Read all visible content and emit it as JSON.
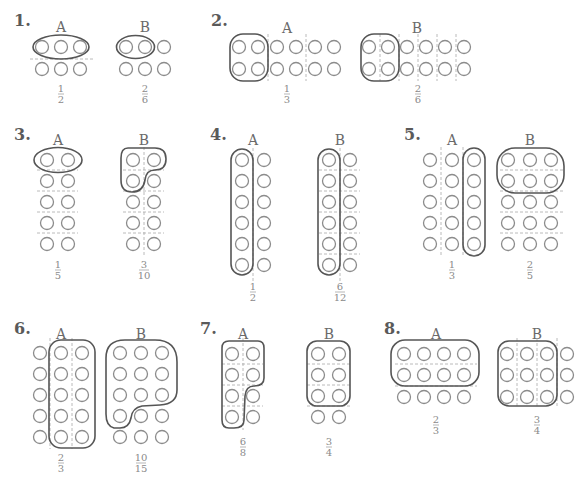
{
  "colors": {
    "circle": "#8c8c8c",
    "group_outline": "#555555",
    "divider": "#a8a8a8",
    "text": "#6a6a6a"
  },
  "problems": [
    {
      "number": "1.",
      "A": {
        "label": "A",
        "numerator": "1",
        "denominator": "2",
        "grid": "3x2"
      },
      "B": {
        "label": "B",
        "numerator": "2",
        "denominator": "6",
        "grid": "3x2"
      }
    },
    {
      "number": "2.",
      "A": {
        "label": "A",
        "numerator": "1",
        "denominator": "3",
        "grid": "6x2"
      },
      "B": {
        "label": "B",
        "numerator": "2",
        "denominator": "6",
        "grid": "6x2"
      }
    },
    {
      "number": "3.",
      "A": {
        "label": "A",
        "numerator": "1",
        "denominator": "5",
        "grid": "2x5"
      },
      "B": {
        "label": "B",
        "numerator": "3",
        "denominator": "10",
        "grid": "2x5"
      }
    },
    {
      "number": "4.",
      "A": {
        "label": "A",
        "numerator": "1",
        "denominator": "2",
        "grid": "2x6"
      },
      "B": {
        "label": "B",
        "numerator": "6",
        "denominator": "12",
        "grid": "2x6"
      }
    },
    {
      "number": "5.",
      "A": {
        "label": "A",
        "numerator": "1",
        "denominator": "3",
        "grid": "3x5"
      },
      "B": {
        "label": "B",
        "numerator": "2",
        "denominator": "5",
        "grid": "3x5"
      }
    },
    {
      "number": "6.",
      "A": {
        "label": "A",
        "numerator": "2",
        "denominator": "3",
        "grid": "3x5"
      },
      "B": {
        "label": "B",
        "numerator": "10",
        "denominator": "15",
        "grid": "3x5"
      }
    },
    {
      "number": "7.",
      "A": {
        "label": "A",
        "numerator": "6",
        "denominator": "8",
        "grid": "2x4"
      },
      "B": {
        "label": "B",
        "numerator": "3",
        "denominator": "4",
        "grid": "2x4"
      }
    },
    {
      "number": "8.",
      "A": {
        "label": "A",
        "numerator": "2",
        "denominator": "3",
        "grid": "4x3"
      },
      "B": {
        "label": "B",
        "numerator": "3",
        "denominator": "4",
        "grid": "4x3"
      }
    }
  ]
}
